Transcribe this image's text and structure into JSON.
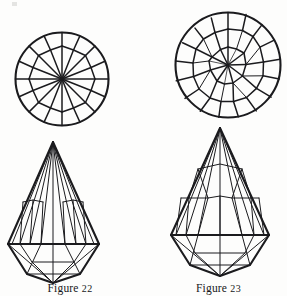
{
  "plate": {
    "title": "Gem cut diagrams plate",
    "background_color": "#fdfdfc",
    "ink_color": "#1b1b1e",
    "figure_count": 2
  },
  "figures": [
    {
      "id": "figure-22",
      "caption_label": "Figure",
      "caption_number": "22",
      "caption": "Figure 22",
      "views": [
        {
          "name": "crown-plan-view",
          "shape": "circle",
          "description": "Round brilliant cut seen from above",
          "symmetry_order": 8,
          "center": {
            "x": 62,
            "y": 79
          },
          "radius": 47,
          "facet_rows": 3,
          "star_points": 8
        },
        {
          "name": "profile-view",
          "shape": "pendeloque-drop",
          "description": "Pear drop briolette cut seen from the side",
          "apex": {
            "x": 53,
            "y": 142
          },
          "girdle_y": 245,
          "culet": {
            "x": 53,
            "y": 283
          },
          "girdle_left_x": 6,
          "girdle_right_x": 101,
          "crown_facet_rays": 11
        }
      ]
    },
    {
      "id": "figure-23",
      "caption_label": "Figure",
      "caption_number": "23",
      "caption": "Figure 23",
      "views": [
        {
          "name": "crown-plan-view",
          "shape": "circle",
          "description": "Complex rose/brilliant cut seen from above",
          "symmetry_order": 9,
          "center": {
            "x": 78,
            "y": 65
          },
          "radius": 53,
          "facet_rows": 4,
          "star_points": 9
        },
        {
          "name": "profile-view",
          "shape": "pendeloque-drop",
          "description": "Elongated pear drop cut seen from the side",
          "apex": {
            "x": 70,
            "y": 128
          },
          "girdle_y": 243,
          "culet": {
            "x": 70,
            "y": 285
          },
          "girdle_left_x": 14,
          "girdle_right_x": 126,
          "crown_facet_rays": 9
        }
      ]
    }
  ],
  "artifacts": {
    "scan_speck_top_left": true
  }
}
